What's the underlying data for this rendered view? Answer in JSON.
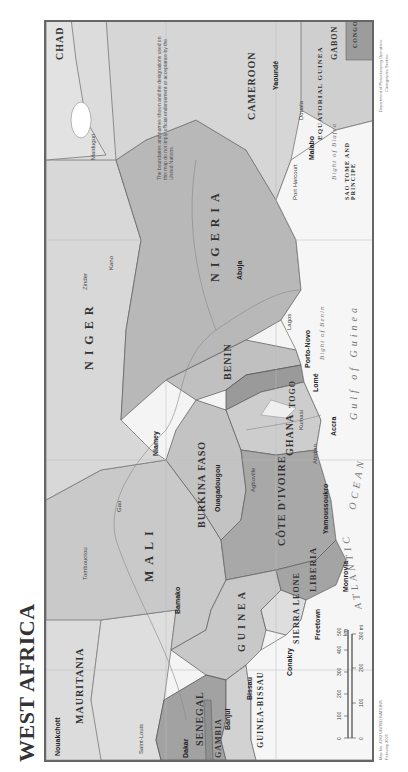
{
  "map": {
    "title": "WEST AFRICA",
    "note": "The boundaries and names shown and the designations used on this map do not imply official endorsement or acceptance by the United Nations.",
    "countries": [
      {
        "name": "MAURITANIA"
      },
      {
        "name": "MALI"
      },
      {
        "name": "NIGER"
      },
      {
        "name": "NIGERIA"
      },
      {
        "name": "CHAD"
      },
      {
        "name": "CAMEROON"
      },
      {
        "name": "SENEGAL"
      },
      {
        "name": "GAMBIA"
      },
      {
        "name": "GUINEA-BISSAU"
      },
      {
        "name": "GUINEA"
      },
      {
        "name": "SIERRA LEONE"
      },
      {
        "name": "LIBERIA"
      },
      {
        "name": "CÔTE D'IVOIRE"
      },
      {
        "name": "BURKINA FASO"
      },
      {
        "name": "GHANA"
      },
      {
        "name": "TOGO"
      },
      {
        "name": "BENIN"
      },
      {
        "name": "EQUATORIAL GUINEA"
      },
      {
        "name": "GABON"
      },
      {
        "name": "CONGO"
      },
      {
        "name": "SAO TOME AND PRINCIPE"
      }
    ],
    "capitals": [
      "Nouakchott",
      "Dakar",
      "Banjul",
      "Bissau",
      "Conakry",
      "Freetown",
      "Monrovia",
      "Yamoussoukro",
      "Bamako",
      "Ouagadougou",
      "Niamey",
      "Accra",
      "Lomé",
      "Porto-Novo",
      "Abuja",
      "Malabo",
      "Yaoundé"
    ],
    "cities": [
      "Saint-Louis",
      "Thiès",
      "Kaolack",
      "Diourbel",
      "Tambacounda",
      "Ziguinchor",
      "Kayes",
      "Nioro",
      "Aïoun el Atrouss",
      "Néma",
      "Tombouctou",
      "Gao",
      "Ségou",
      "Sikasso",
      "Kankan",
      "Labé",
      "Kindia",
      "Bo",
      "Bonthe",
      "Buchanan",
      "Korhogo",
      "Bouaké",
      "Daloa",
      "Gagnoa",
      "Sassandra",
      "Abidjan",
      "Agboville",
      "Bobo-Dioulasso",
      "Tamale",
      "Kumasi",
      "Koforidua",
      "Takoradi",
      "Cape Three Points",
      "Sokodé",
      "Djougou",
      "Parakou",
      "Dosso",
      "Birnin Konni",
      "Tahoua",
      "Maradi",
      "Zinder",
      "Kano",
      "Kaduna",
      "Diffa",
      "Potiskum",
      "Maiduguri",
      "Gombe",
      "Ogbomosho",
      "Oshogbo",
      "Ibadan",
      "Lagos",
      "Benin City",
      "Enugu",
      "Calabar",
      "Port Harcourt",
      "Douala",
      "Ngaoundéré",
      "Ebolowa",
      "Kribi",
      "Kédougou",
      "Rosso",
      "Kaédi"
    ],
    "water": {
      "atlantic": "ATLANTIC",
      "ocean": "OCEAN",
      "gulf": "Gulf of Guinea",
      "bight_benin": "Bight of Benin",
      "bight_biafra": "Bight of Biafra",
      "lake_chad": "Lake Chad",
      "lake_volta": "Lake Volta"
    },
    "scale": {
      "km_ticks": [
        "0",
        "100",
        "200",
        "300",
        "400",
        "500 km"
      ],
      "mi_ticks": [
        "0",
        "100",
        "200",
        "300 mi"
      ]
    },
    "credits": {
      "map_no": "Map No. 4242   UNITED NATIONS",
      "date": "February 2005",
      "dept": "Department of Peacekeeping Operations",
      "section": "Cartographic Section"
    },
    "colors": {
      "land_dark": "#a9a9a9",
      "land_mid": "#c4c4c4",
      "land_light": "#dadada",
      "sea": "#f4f4f4",
      "border": "#666666"
    }
  }
}
